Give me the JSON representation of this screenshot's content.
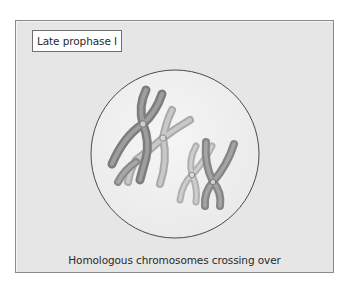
{
  "figure": {
    "stage_label": "Late prophase I",
    "caption": "Homologous chromosomes crossing over"
  },
  "colors": {
    "page_background": "#ffffff",
    "panel_background": "#e6e6e6",
    "panel_border": "#8a8a8a",
    "nucleus_fill": "#efefef",
    "nucleus_outline": "#4a4a4a",
    "chromosome_dark": "#8c8c8c",
    "chromosome_light": "#bdbdbd",
    "text": "#2a2a2a"
  },
  "diagram": {
    "nucleus": {
      "cx": 175,
      "cy": 154,
      "r": 84
    },
    "chromosome_pairs": [
      {
        "name": "left-homologous-pair",
        "dark_centromere": [
          143,
          124
        ],
        "light_centromere": [
          163,
          138
        ]
      },
      {
        "name": "right-homologous-pair",
        "light_centromere": [
          192,
          175
        ],
        "dark_centromere": [
          213,
          182
        ]
      }
    ]
  }
}
